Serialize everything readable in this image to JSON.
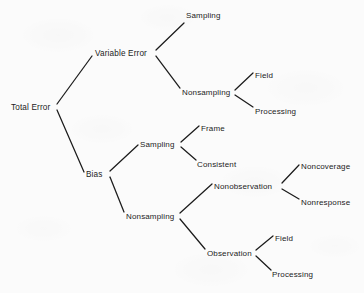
{
  "diagram": {
    "title": "Total Error",
    "type": "hierarchical-tree",
    "ink_color": "#1b1b1b",
    "background_color": "#fbfbfb",
    "nodes": [
      {
        "id": "total-error",
        "label": "Total Error",
        "x": 11,
        "y": 103
      },
      {
        "id": "variable-error",
        "label": "Variable Error",
        "x": 95,
        "y": 49
      },
      {
        "id": "var-sampling",
        "label": "Sampling",
        "x": 186,
        "y": 11
      },
      {
        "id": "var-nonsampling",
        "label": "Nonsampling",
        "x": 182,
        "y": 88
      },
      {
        "id": "var-ns-field",
        "label": "Field",
        "x": 255,
        "y": 71
      },
      {
        "id": "var-ns-processing",
        "label": "Processing",
        "x": 255,
        "y": 107
      },
      {
        "id": "bias",
        "label": "Bias",
        "x": 86,
        "y": 170
      },
      {
        "id": "bias-sampling",
        "label": "Sampling",
        "x": 140,
        "y": 140
      },
      {
        "id": "bias-s-frame",
        "label": "Frame",
        "x": 201,
        "y": 124
      },
      {
        "id": "bias-s-consistent",
        "label": "Consistent",
        "x": 197,
        "y": 160
      },
      {
        "id": "bias-nonsampling",
        "label": "Nonsampling",
        "x": 126,
        "y": 212
      },
      {
        "id": "nonobservation",
        "label": "Nonobservation",
        "x": 214,
        "y": 182
      },
      {
        "id": "noncoverage",
        "label": "Noncoverage",
        "x": 301,
        "y": 162
      },
      {
        "id": "nonresponse",
        "label": "Nonresponse",
        "x": 301,
        "y": 198
      },
      {
        "id": "observation",
        "label": "Observation",
        "x": 207,
        "y": 249
      },
      {
        "id": "obs-field",
        "label": "Field",
        "x": 275,
        "y": 234
      },
      {
        "id": "obs-processing",
        "label": "Processing",
        "x": 272,
        "y": 270
      }
    ],
    "edges": [
      {
        "id": "edge-total-variable",
        "from": "total-error",
        "to": "variable-error",
        "x1": 57,
        "y1": 104,
        "x2": 92,
        "y2": 56
      },
      {
        "id": "edge-total-bias",
        "from": "total-error",
        "to": "bias",
        "x1": 57,
        "y1": 110,
        "x2": 84,
        "y2": 172
      },
      {
        "id": "edge-variable-sampling",
        "from": "variable-error",
        "to": "var-sampling",
        "x1": 156,
        "y1": 50,
        "x2": 184,
        "y2": 23
      },
      {
        "id": "edge-variable-nonsampling",
        "from": "variable-error",
        "to": "var-nonsampling",
        "x1": 156,
        "y1": 56,
        "x2": 180,
        "y2": 88
      },
      {
        "id": "edge-ns-field",
        "from": "var-nonsampling",
        "to": "var-ns-field",
        "x1": 235,
        "y1": 90,
        "x2": 253,
        "y2": 73
      },
      {
        "id": "edge-ns-processing",
        "from": "var-nonsampling",
        "to": "var-ns-processing",
        "x1": 235,
        "y1": 95,
        "x2": 253,
        "y2": 107
      },
      {
        "id": "edge-bias-sampling",
        "from": "bias",
        "to": "bias-sampling",
        "x1": 110,
        "y1": 171,
        "x2": 138,
        "y2": 145
      },
      {
        "id": "edge-bias-nonsampling",
        "from": "bias",
        "to": "bias-nonsampling",
        "x1": 110,
        "y1": 177,
        "x2": 124,
        "y2": 212
      },
      {
        "id": "edge-sampling-frame",
        "from": "bias-sampling",
        "to": "bias-s-frame",
        "x1": 181,
        "y1": 142,
        "x2": 199,
        "y2": 126
      },
      {
        "id": "edge-sampling-consistent",
        "from": "bias-sampling",
        "to": "bias-s-consistent",
        "x1": 181,
        "y1": 147,
        "x2": 196,
        "y2": 160
      },
      {
        "id": "edge-bns-nonobservation",
        "from": "bias-nonsampling",
        "to": "nonobservation",
        "x1": 180,
        "y1": 213,
        "x2": 212,
        "y2": 184
      },
      {
        "id": "edge-bns-observation",
        "from": "bias-nonsampling",
        "to": "observation",
        "x1": 180,
        "y1": 219,
        "x2": 205,
        "y2": 249
      },
      {
        "id": "edge-nonobs-noncoverage",
        "from": "nonobservation",
        "to": "noncoverage",
        "x1": 282,
        "y1": 183,
        "x2": 299,
        "y2": 165
      },
      {
        "id": "edge-nonobs-nonresponse",
        "from": "nonobservation",
        "to": "nonresponse",
        "x1": 282,
        "y1": 189,
        "x2": 299,
        "y2": 199
      },
      {
        "id": "edge-obs-field",
        "from": "observation",
        "to": "obs-field",
        "x1": 256,
        "y1": 250,
        "x2": 273,
        "y2": 236
      },
      {
        "id": "edge-obs-processing",
        "from": "observation",
        "to": "obs-processing",
        "x1": 256,
        "y1": 256,
        "x2": 271,
        "y2": 270
      }
    ]
  }
}
